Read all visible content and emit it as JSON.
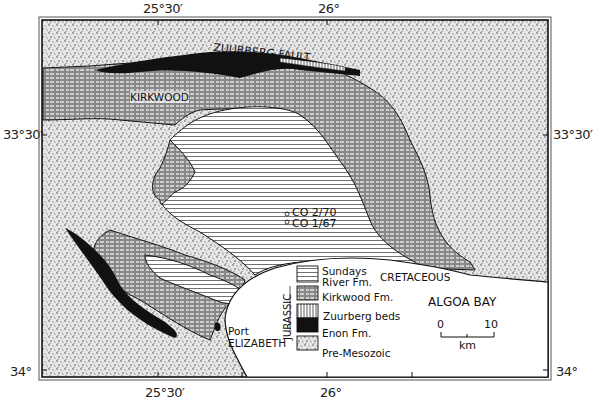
{
  "map": {
    "title": "",
    "region": "Algoa Basin, Eastern Cape",
    "longitude_ticks": {
      "top": [
        "25°30′",
        "26°"
      ],
      "bottom": [
        "25°30′",
        "26°"
      ]
    },
    "latitude_ticks": {
      "left": [
        "33°30′",
        "34°"
      ],
      "right": [
        "33°30′",
        "34°"
      ]
    },
    "labels": {
      "fault": "ZUURBERG FAULT",
      "kirkwood": "KIRKWOOD",
      "borehole_1": "CO 2/70",
      "borehole_2": "CO 1/67",
      "city_line1": "Port",
      "city_line2": "ELIZABETH",
      "bay": "ALGOA BAY"
    },
    "legend": {
      "period_cretaceous": "CRETACEOUS",
      "period_jurassic": "JURASSIC",
      "items": [
        {
          "label_line1": "Sundays",
          "label_line2": "River Fm.",
          "pattern": "horizontal-lines"
        },
        {
          "label_line1": "Kirkwood Fm.",
          "label_line2": "",
          "pattern": "dashed-horizontal"
        },
        {
          "label_line1": "Zuurberg beds",
          "label_line2": "",
          "pattern": "vertical-lines"
        },
        {
          "label_line1": "Enon Fm.",
          "label_line2": "",
          "pattern": "solid-black"
        },
        {
          "label_line1": "Pre-Mesozoic",
          "label_line2": "",
          "pattern": "stipple"
        }
      ]
    },
    "scale_bar": {
      "start": "0",
      "end": "10",
      "unit": "km"
    },
    "colors": {
      "ink": "#111111",
      "paper": "#ffffff",
      "stipple_bg": "#e4e4e4"
    }
  }
}
